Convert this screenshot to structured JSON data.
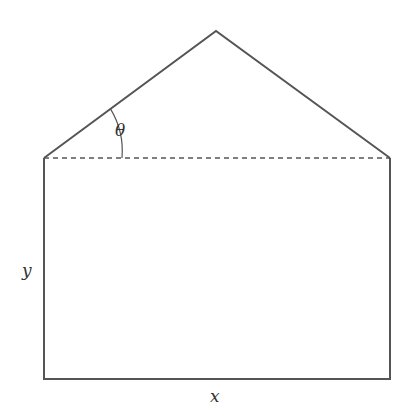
{
  "diagram": {
    "title": "",
    "shape": "rectangle surmounted by isosceles triangle (Norman-window-like pentagon)",
    "labels": {
      "angle": "θ",
      "height": "y",
      "width": "x"
    },
    "geometry": {
      "apex": [
        216,
        31
      ],
      "left_corner": [
        44,
        158
      ],
      "right_corner": [
        390,
        158
      ],
      "bottom_left": [
        44,
        379
      ],
      "bottom_right": [
        390,
        379
      ]
    },
    "colors": {
      "line": "#555555",
      "text": "#333333",
      "background": "#ffffff"
    }
  }
}
